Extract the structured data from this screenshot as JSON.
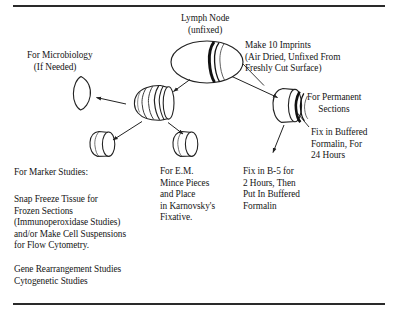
{
  "figure": {
    "kind": "lymph-node-handling-flow-diagram",
    "background": "#ffffff",
    "ink": "#151515"
  },
  "labels": {
    "lymph_node": "Lymph Node\n(unfixed)",
    "microbiology": "For Microbiology\n   (If Needed)",
    "imprints": "Make 10 Imprints\n(Air Dried, Unfixed From\nFreshly Cut Surface)",
    "permanent_sections": "For Permanent\n     Sections",
    "fix_buffered_formalin": "Fix in Buffered\nFormalin, For\n24 Hours",
    "fix_b5": "Fix in B-5 for\n2 Hours, Then\nPut In Buffered\nFormalin",
    "electron_microscopy": "For E.M.\nMince Pieces\nand Place\nin Karnovsky's\nFixative.",
    "marker_studies_heading": "For Marker Studies:",
    "marker_studies_body": "Snap Freeze Tissue for\nFrozen Sections\n(Immunoperoxidase Studies)\nand/or Make Cell Suspensions\nfor Flow Cytometry.",
    "gene_studies": "Gene Rearrangement Studies\nCytogenetic Studies"
  },
  "shapes": {
    "lymph_node_ellipse": "whole unfixed lymph node, cut surface marked",
    "central_sliced_block": "bisected node half with serial slices",
    "microbiology_sliver": "thin tissue sliver for culture",
    "marker_disc": "tissue disc for marker studies",
    "em_disc": "tissue disc for electron microscopy",
    "permanent_block": "tissue block with slices for permanent sections"
  },
  "arrows": [
    {
      "name": "node-to-central-block",
      "from": "lymph_node_ellipse",
      "to": "central_sliced_block"
    },
    {
      "name": "node-to-permanent-block",
      "from": "lymph_node_ellipse",
      "to": "permanent_block"
    },
    {
      "name": "central-to-microbiology",
      "from": "central_sliced_block",
      "to": "microbiology_sliver"
    },
    {
      "name": "central-to-marker-disc",
      "from": "central_sliced_block",
      "to": "marker_disc"
    },
    {
      "name": "central-to-em-disc",
      "from": "central_sliced_block",
      "to": "em_disc"
    },
    {
      "name": "permanent-to-b5",
      "from": "permanent_block",
      "to": "fix_b5_label"
    }
  ],
  "leaders": [
    {
      "name": "imprints-leader",
      "to": "permanent_block"
    },
    {
      "name": "formalin-leader",
      "to": "permanent_block"
    },
    {
      "name": "marker-leader",
      "to": "central_sliced_block"
    }
  ]
}
